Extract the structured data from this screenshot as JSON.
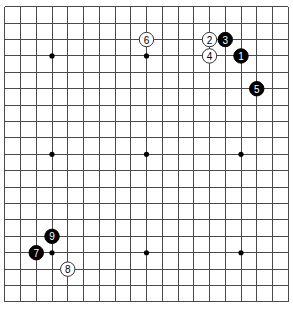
{
  "board": {
    "size": 19,
    "origin_x": 4.75,
    "origin_y": 6.75,
    "spacing_x": 15.75,
    "spacing_y": 16.4,
    "line_color": "#4a4a4a",
    "background": "#ffffff",
    "star_points": [
      [
        3,
        3
      ],
      [
        9,
        3
      ],
      [
        15,
        3
      ],
      [
        3,
        9
      ],
      [
        9,
        9
      ],
      [
        15,
        9
      ],
      [
        3,
        15
      ],
      [
        9,
        15
      ],
      [
        15,
        15
      ]
    ],
    "stone_radius": 7.2
  },
  "stones": [
    {
      "move": "1",
      "color": "black",
      "col": 15,
      "row": 3
    },
    {
      "move": "2",
      "color": "white",
      "col": 13,
      "row": 2
    },
    {
      "move": "3",
      "color": "black",
      "col": 14,
      "row": 2
    },
    {
      "move": "4",
      "color": "white",
      "col": 13,
      "row": 3
    },
    {
      "move": "5",
      "color": "black",
      "col": 16,
      "row": 5
    },
    {
      "move": "6",
      "color": "white",
      "col": 9,
      "row": 2
    },
    {
      "move": "7",
      "color": "black",
      "col": 2,
      "row": 15
    },
    {
      "move": "8",
      "color": "white",
      "col": 4,
      "row": 16
    },
    {
      "move": "9",
      "color": "black",
      "col": 3,
      "row": 14
    }
  ]
}
